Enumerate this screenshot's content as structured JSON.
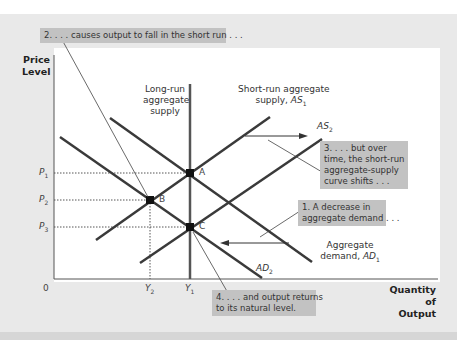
{
  "axes": {
    "y_title_line1": "Price",
    "y_title_line2": "Level",
    "x_title_line1": "Quantity of",
    "x_title_line2": "Output",
    "origin": "0",
    "y_ticks": [
      {
        "label": "P",
        "sub": "1"
      },
      {
        "label": "P",
        "sub": "2"
      },
      {
        "label": "P",
        "sub": "3"
      }
    ],
    "x_ticks": [
      {
        "label": "Y",
        "sub": "2"
      },
      {
        "label": "Y",
        "sub": "1"
      }
    ]
  },
  "curves": {
    "lras_line1": "Long-run",
    "lras_line2": "aggregate",
    "lras_line3": "supply",
    "as1_line1": "Short-run aggregate",
    "as1_line2": "supply, ",
    "as1_sym": "AS",
    "as1_sub": "1",
    "as2_sym": "AS",
    "as2_sub": "2",
    "ad1_line1": "Aggregate",
    "ad1_line2": "demand, ",
    "ad1_sym": "AD",
    "ad1_sub": "1",
    "ad2_sym": "AD",
    "ad2_sub": "2"
  },
  "points": {
    "a": "A",
    "b": "B",
    "c": "C"
  },
  "notes": {
    "n1_line1": "1. A decrease in",
    "n1_line2": "aggregate demand . . .",
    "n2": "2. . . . causes output to fall in the short run . . .",
    "n3_line1": "3. . . . but over",
    "n3_line2": "time, the short-run",
    "n3_line3": "aggregate-supply",
    "n3_line4": "curve shifts . . .",
    "n4_line1": "4. . . . and output returns",
    "n4_line2": "to its natural level."
  },
  "colors": {
    "curve": "#3a3a3a",
    "note_bg": "#c2c2c2",
    "frame_bg": "#e9e9e9"
  }
}
